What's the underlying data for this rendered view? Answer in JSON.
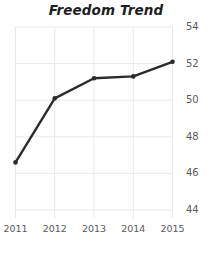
{
  "chart_data": {
    "type": "line",
    "title": "Freedom Trend",
    "xlabel": "",
    "ylabel": "",
    "categories": [
      "2011",
      "2012",
      "2013",
      "2014",
      "2015"
    ],
    "x": [
      2011,
      2012,
      2013,
      2014,
      2015
    ],
    "values": [
      46.6,
      50.1,
      51.2,
      51.3,
      52.1
    ],
    "series": [
      {
        "name": "Freedom Trend",
        "values": [
          46.6,
          50.1,
          51.2,
          51.3,
          52.1
        ]
      }
    ],
    "ylim": [
      44,
      54
    ],
    "xlim": [
      2011,
      2015
    ],
    "yticks": [
      54,
      52,
      50,
      48,
      46,
      44
    ],
    "ytick_labels": [
      "54",
      "52",
      "50",
      "48",
      "46",
      "44"
    ],
    "xticks": [
      2011,
      2012,
      2013,
      2014,
      2015
    ],
    "xtick_labels": [
      "2011",
      "2012",
      "2013",
      "2014",
      "2015"
    ],
    "grid": true,
    "grid_axis": "both",
    "legend": false,
    "legend_position": "none",
    "y_axis_side": "right",
    "markers": true,
    "marker_style": "circle",
    "colors": {
      "line": "#2b2b2b",
      "marker": "#2b2b2b",
      "grid": "#e9e9e9",
      "title": "#1e1e1e",
      "tick_label": "#5a5a5a",
      "background": "#ffffff"
    }
  }
}
